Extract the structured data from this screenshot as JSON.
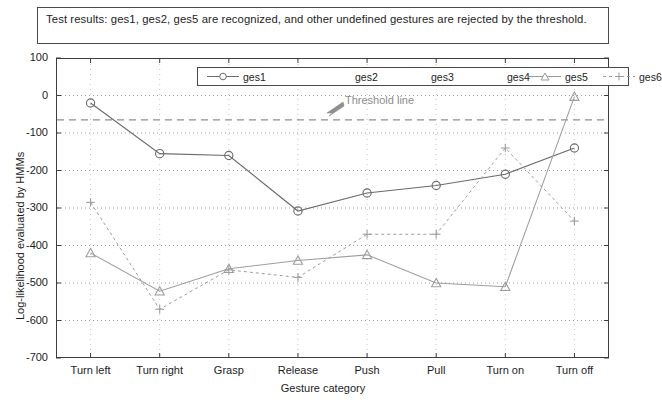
{
  "caption": {
    "text": "Test results: ges1, ges2, ges5 are recognized, and other undefined gestures are rejected by the threshold."
  },
  "annotation": {
    "threshold_label": "Threshold line"
  },
  "legend": {
    "items": [
      {
        "label": "ges1",
        "marker": "circle",
        "line": "solid",
        "color": "#6b6b6b"
      },
      {
        "label": "ges2",
        "marker": "none",
        "line": "none",
        "color": "#c9c9c9"
      },
      {
        "label": "ges3",
        "marker": "none",
        "line": "none",
        "color": "#c9c9c9"
      },
      {
        "label": "ges4",
        "marker": "none",
        "line": "none",
        "color": "#c9c9c9"
      },
      {
        "label": "ges5",
        "marker": "triangle",
        "line": "solid",
        "color": "#9a9a9a"
      },
      {
        "label": "ges6",
        "marker": "plus",
        "line": "dotted",
        "color": "#9a9a9a"
      }
    ]
  },
  "chart_data": {
    "type": "line",
    "title": "Test results: ges1, ges2, ges5 are recognized, and other undefined gestures are rejected by the threshold.",
    "xlabel": "Gesture category",
    "ylabel": "Log-likelihood evaluated by HMMs",
    "categories": [
      "Turn left",
      "Turn right",
      "Grasp",
      "Release",
      "Push",
      "Pull",
      "Turn on",
      "Turn off"
    ],
    "ylim": [
      -700,
      100
    ],
    "yticks": [
      100,
      0,
      -100,
      -200,
      -300,
      -400,
      -500,
      -600,
      -700
    ],
    "grid": true,
    "legend_position": "top-center-inside",
    "threshold": {
      "value": -65,
      "label": "Threshold line",
      "style": "dashed"
    },
    "series": [
      {
        "name": "ges1",
        "marker": "circle",
        "values": [
          -20,
          -155,
          -160,
          -308,
          -260,
          -240,
          -210,
          -140
        ]
      },
      {
        "name": "ges5",
        "marker": "triangle",
        "values": [
          -420,
          -522,
          -462,
          -440,
          -425,
          -500,
          -510,
          -3
        ]
      },
      {
        "name": "ges6",
        "marker": "plus",
        "values": [
          -285,
          -570,
          -465,
          -485,
          -370,
          -370,
          -140,
          -335
        ]
      }
    ]
  },
  "axes": {
    "ytick_labels": [
      "100",
      "0",
      "-100",
      "-200",
      "-300",
      "-400",
      "-500",
      "-600",
      "-700"
    ],
    "xtick_labels": [
      "Turn left",
      "Turn right",
      "Grasp",
      "Release",
      "Push",
      "Pull",
      "Turn on",
      "Turn off"
    ],
    "ylabel": "Log-likelihood evaluated by HMMs",
    "xlabel": "Gesture category"
  }
}
